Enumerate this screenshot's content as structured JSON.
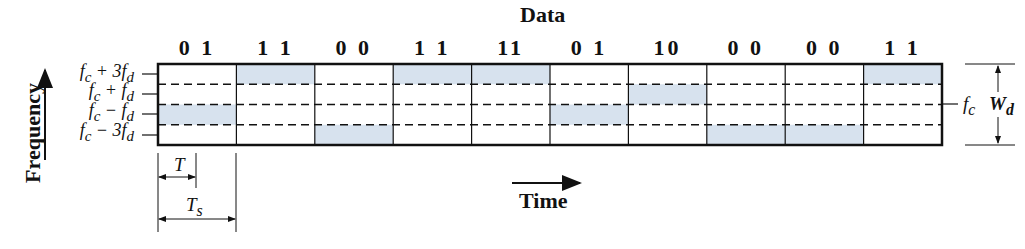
{
  "title": "Data",
  "symbols": [
    "0 1",
    "1 1",
    "0 0",
    "1 1",
    "11",
    "0 1",
    "10",
    "0 0",
    "0 0",
    "1 1"
  ],
  "frequency_levels": [
    "f_c + 3f_d",
    "f_c + f_d",
    "f_c − f_d",
    "f_c − 3f_d"
  ],
  "frequency_labels_html": [
    "f<sub>c</sub> + 3f<sub>d</sub>",
    "f<sub>c</sub> + f<sub>d</sub>",
    "f<sub>c</sub> − f<sub>d</sub>",
    "f<sub>c</sub> − 3f<sub>d</sub>"
  ],
  "symbol_to_level_index": [
    2,
    0,
    3,
    0,
    0,
    2,
    1,
    3,
    3,
    0
  ],
  "y_axis_label": "Frequency",
  "x_axis_label": "Time",
  "bit_period_label": "T",
  "symbol_period_label": "T_s",
  "center_label": "f_c",
  "bandwidth_label": "W_d",
  "fill_color": "#d7e2ee",
  "line_color": "#111111"
}
